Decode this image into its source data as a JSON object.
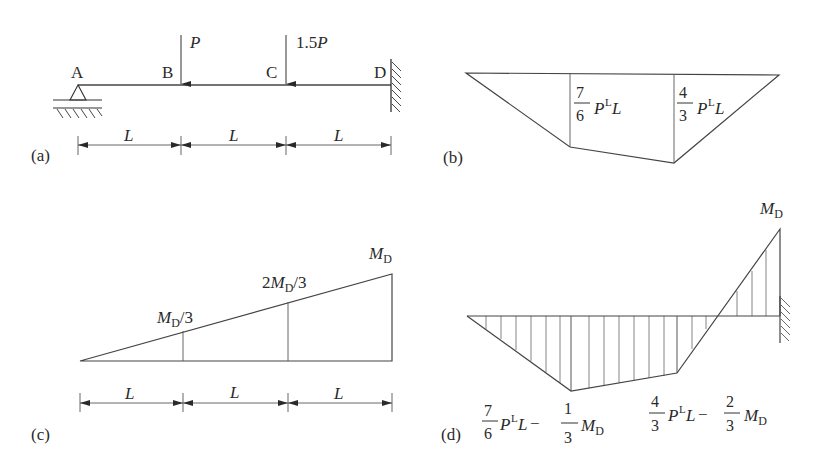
{
  "figure": {
    "panels": [
      {
        "id": "a",
        "label": "(a)",
        "type": "beam_loading",
        "nodes": [
          "A",
          "B",
          "C",
          "D"
        ],
        "loads": [
          {
            "at": "B",
            "label_text": "P"
          },
          {
            "at": "C",
            "label_prefix": "1.5",
            "label_var": "P"
          }
        ],
        "supports": {
          "A": "pinned-roller",
          "D": "fixed"
        },
        "spans": [
          "L",
          "L",
          "L"
        ]
      },
      {
        "id": "b",
        "label": "(b)",
        "type": "moment_diagram",
        "values": [
          {
            "at": "B",
            "num": "7",
            "den": "6",
            "var": "P",
            "sup": "L",
            "tail": "L"
          },
          {
            "at": "C",
            "num": "4",
            "den": "3",
            "var": "P",
            "sup": "L",
            "tail": "L"
          }
        ]
      },
      {
        "id": "c",
        "label": "(c)",
        "type": "moment_diagram",
        "values": [
          {
            "at": "B",
            "text_main": "M",
            "text_sub": "D",
            "text_tail": "/3"
          },
          {
            "at": "C",
            "text_pre": "2",
            "text_main": "M",
            "text_sub": "D",
            "text_tail": "/3"
          },
          {
            "at": "D",
            "text_main": "M",
            "text_sub": "D"
          }
        ],
        "spans": [
          "L",
          "L",
          "L"
        ]
      },
      {
        "id": "d",
        "label": "(d)",
        "type": "combined_moment_diagram",
        "values": [
          {
            "at": "B",
            "num1": "7",
            "den1": "6",
            "var": "P",
            "sup": "L",
            "tail": "L",
            "minus": "−",
            "num2": "1",
            "den2": "3",
            "m": "M",
            "msub": "D"
          },
          {
            "at": "C",
            "num1": "4",
            "den1": "3",
            "var": "P",
            "sup": "L",
            "tail": "L",
            "minus": "−",
            "num2": "2",
            "den2": "3",
            "m": "M",
            "msub": "D"
          },
          {
            "at": "D",
            "m": "M",
            "msub": "D"
          }
        ]
      }
    ]
  }
}
